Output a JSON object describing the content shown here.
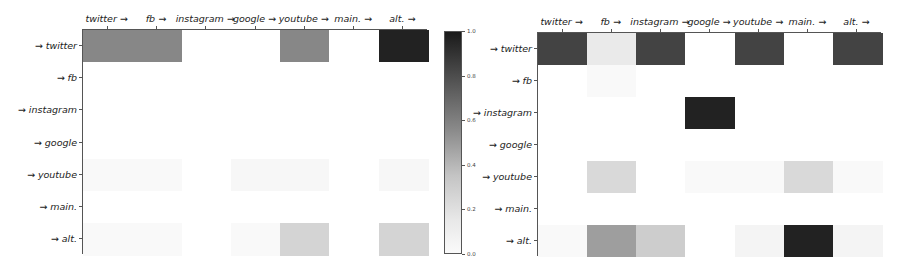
{
  "chart_data": [
    {
      "type": "heatmap",
      "title": "",
      "xlabel": "",
      "ylabel": "",
      "x_labels": [
        "twitter →",
        "fb →",
        "instagram →",
        "google →",
        "youtube →",
        "main. →",
        "alt. →"
      ],
      "y_labels": [
        "→ twitter",
        "→ fb",
        "→ instagram",
        "→ google",
        "→ youtube",
        "→ main.",
        "→ alt."
      ],
      "values": [
        [
          0.5,
          0.5,
          0.0,
          0.0,
          0.5,
          0.0,
          0.95
        ],
        [
          0.0,
          0.0,
          0.0,
          0.0,
          0.0,
          0.0,
          0.0
        ],
        [
          0.0,
          0.0,
          0.0,
          0.0,
          0.0,
          0.0,
          0.0
        ],
        [
          0.0,
          0.0,
          0.0,
          0.0,
          0.0,
          0.0,
          0.0
        ],
        [
          0.02,
          0.02,
          0.0,
          0.03,
          0.03,
          0.0,
          0.03
        ],
        [
          0.0,
          0.0,
          0.0,
          0.0,
          0.0,
          0.0,
          0.0
        ],
        [
          0.02,
          0.02,
          0.0,
          0.02,
          0.17,
          0.0,
          0.17
        ]
      ],
      "colormap": "Greys",
      "vmin": 0.0,
      "vmax": 1.0
    },
    {
      "type": "heatmap",
      "title": "",
      "xlabel": "",
      "ylabel": "",
      "x_labels": [
        "twitter →",
        "fb →",
        "instagram →",
        "google →",
        "youtube →",
        "main. →",
        "alt. →"
      ],
      "y_labels": [
        "→ twitter",
        "→ fb",
        "→ instagram",
        "→ google",
        "→ youtube",
        "→ main.",
        "→ alt."
      ],
      "values": [
        [
          0.8,
          0.08,
          0.8,
          0.0,
          0.8,
          0.0,
          0.8
        ],
        [
          0.0,
          0.02,
          0.0,
          0.0,
          0.0,
          0.0,
          0.0
        ],
        [
          0.0,
          0.0,
          0.0,
          0.95,
          0.0,
          0.0,
          0.0
        ],
        [
          0.0,
          0.0,
          0.0,
          0.0,
          0.0,
          0.0,
          0.0
        ],
        [
          0.0,
          0.15,
          0.0,
          0.02,
          0.02,
          0.15,
          0.02
        ],
        [
          0.0,
          0.0,
          0.0,
          0.0,
          0.0,
          0.0,
          0.0
        ],
        [
          0.02,
          0.4,
          0.2,
          0.0,
          0.04,
          0.95,
          0.04
        ]
      ],
      "colormap": "Greys",
      "vmin": 0.0,
      "vmax": 1.0
    }
  ],
  "colorbar": {
    "ticks": [
      "1.0",
      "0.8",
      "0.6",
      "0.4",
      "0.2",
      "0.0"
    ],
    "tick_values": [
      1.0,
      0.8,
      0.6,
      0.4,
      0.2,
      0.0
    ]
  },
  "left": {
    "x_labels": [
      "twitter →",
      "fb →",
      "instagram →",
      "google →",
      "youtube →",
      "main. →",
      "alt. →"
    ],
    "y_labels": [
      "→ twitter",
      "→ fb",
      "→ instagram",
      "→ google",
      "→ youtube",
      "→ main.",
      "→ alt."
    ]
  },
  "right": {
    "x_labels": [
      "twitter →",
      "fb →",
      "instagram →",
      "google →",
      "youtube →",
      "main. →",
      "alt. →"
    ],
    "y_labels": [
      "→ twitter",
      "→ fb",
      "→ instagram",
      "→ google",
      "→ youtube",
      "→ main.",
      "→ alt."
    ]
  }
}
